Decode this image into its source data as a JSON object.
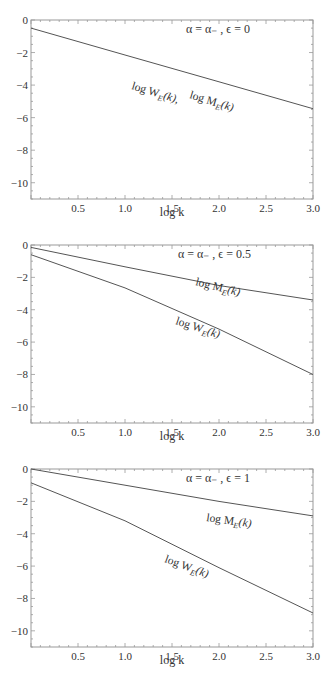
{
  "chart_data": [
    {
      "type": "line",
      "title": "",
      "annotation": "α = α₋ , ϵ = 0",
      "xlabel": "log k",
      "ylabel": "",
      "xlim": [
        0,
        3
      ],
      "ylim": [
        -11,
        0
      ],
      "xticks": [
        "0.5",
        "1.0",
        "1.5",
        "2.0",
        "2.5",
        "3.0"
      ],
      "yticks": [
        "0",
        "−2",
        "−4",
        "−6",
        "−8",
        "−10"
      ],
      "grid": false,
      "x": [
        0,
        1,
        2,
        3
      ],
      "series": [
        {
          "name": "log W_E(k), log M_E(k)",
          "values": [
            -0.5,
            -2.15,
            -3.8,
            -5.45
          ]
        }
      ],
      "curve_labels": [
        "log W",
        "E",
        "(k),",
        "log M",
        "E",
        "(k)"
      ]
    },
    {
      "type": "line",
      "title": "",
      "annotation": "α = α₋ , ϵ = 0.5",
      "xlabel": "log k",
      "ylabel": "",
      "xlim": [
        0,
        3
      ],
      "ylim": [
        -11,
        0
      ],
      "xticks": [
        "0.5",
        "1.0",
        "1.5",
        "2.0",
        "2.5",
        "3.0"
      ],
      "yticks": [
        "0",
        "−2",
        "−4",
        "−6",
        "−8",
        "−10"
      ],
      "grid": false,
      "x": [
        0,
        1,
        2,
        3
      ],
      "series": [
        {
          "name": "log M_E(k)",
          "values": [
            -0.15,
            -1.35,
            -2.5,
            -3.4
          ]
        },
        {
          "name": "log W_E(k)",
          "values": [
            -0.6,
            -2.65,
            -5.2,
            -8.0
          ]
        }
      ],
      "curve_labels": [
        "log M",
        "E",
        "(k)",
        "log W",
        "E",
        "(k)"
      ]
    },
    {
      "type": "line",
      "title": "",
      "annotation": "α = α₋ , ϵ = 1",
      "xlabel": "log k",
      "ylabel": "",
      "xlim": [
        0,
        3
      ],
      "ylim": [
        -11,
        0
      ],
      "xticks": [
        "0.5",
        "1.0",
        "1.5",
        "2.0",
        "2.5",
        "3.0"
      ],
      "yticks": [
        "0",
        "−2",
        "−4",
        "−6",
        "−8",
        "−10"
      ],
      "grid": false,
      "x": [
        0,
        1,
        2,
        3
      ],
      "series": [
        {
          "name": "log M_E(k)",
          "values": [
            0.0,
            -1.0,
            -2.0,
            -2.9
          ]
        },
        {
          "name": "log W_E(k)",
          "values": [
            -0.85,
            -3.2,
            -6.1,
            -8.9
          ]
        }
      ],
      "curve_labels": [
        "log M",
        "E",
        "(k)",
        "log W",
        "E",
        "(k)"
      ]
    }
  ]
}
